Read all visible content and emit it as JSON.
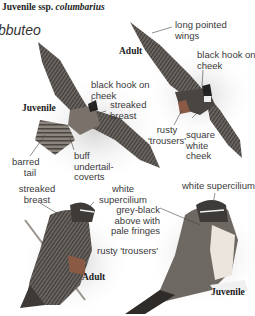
{
  "header": {
    "prefix": "Juvenile ssp.",
    "subspecies": "columbarius"
  },
  "species_fragment": "bbuteo",
  "figures": [
    {
      "id": "flight-juvenile",
      "age": "Juvenile",
      "labels": [
        "black hook on cheek",
        "streaked breast",
        "barred tail",
        "buff undertail-coverts"
      ]
    },
    {
      "id": "flight-adult",
      "age": "Adult",
      "labels": [
        "long pointed wings",
        "black hook on cheek",
        "rusty 'trousers'",
        "square white cheek"
      ]
    },
    {
      "id": "perched-adult",
      "age": "Adult",
      "labels": [
        "streaked breast",
        "white supercilium",
        "rusty 'trousers'"
      ]
    },
    {
      "id": "perched-juvenile",
      "age": "Juvenile",
      "labels": [
        "white supercilium",
        "grey-black above with pale fringes"
      ]
    }
  ],
  "text": {
    "juv_flight_hook_1": "black hook on",
    "juv_flight_hook_2": "cheek",
    "juv_flight_breast_1": "streaked",
    "juv_flight_breast_2": "breast",
    "juv_flight_age": "Juvenile",
    "juv_flight_tail_1": "barred",
    "juv_flight_tail_2": "tail",
    "juv_flight_under_1": "buff",
    "juv_flight_under_2": "undertail-",
    "juv_flight_under_3": "coverts",
    "ad_flight_wings_1": "long pointed",
    "ad_flight_wings_2": "wings",
    "ad_flight_age": "Adult",
    "ad_flight_hook_1": "black hook on",
    "ad_flight_hook_2": "cheek",
    "ad_flight_trousers_1": "rusty",
    "ad_flight_trousers_2": "'trousers'",
    "ad_flight_cheek_1": "square",
    "ad_flight_cheek_2": "white",
    "ad_flight_cheek_3": "cheek",
    "ad_perch_breast_1": "streaked",
    "ad_perch_breast_2": "breast",
    "ad_perch_super_1": "white",
    "ad_perch_super_2": "supercilium",
    "ad_perch_trousers": "rusty 'trousers'",
    "ad_perch_age": "Adult",
    "juv_perch_super": "white supercilium",
    "juv_perch_grey_1": "grey-black",
    "juv_perch_grey_2": "above with",
    "juv_perch_grey_3": "pale fringes",
    "juv_perch_age": "Juvenile"
  },
  "colors": {
    "plumage_dark": "#3d3a38",
    "plumage_mid": "#6e6862",
    "plumage_light": "#b9b2aa",
    "rust": "#8a5a44",
    "shadow": "#cfcfcf"
  }
}
